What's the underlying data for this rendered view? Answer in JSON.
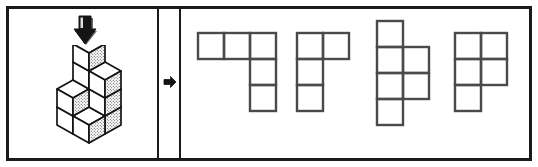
{
  "figure": {
    "type": "spatial-reasoning-puzzle",
    "colors": {
      "frame_border": "#1a1a1a",
      "ink": "#3a3a3a",
      "grid_stroke": "#4a4a4a",
      "cube_stroke": "#1a1a1a",
      "cube_top_fill": "#ffffff",
      "cube_left_fill": "#ffffff",
      "cube_right_fill_pattern": "stipple",
      "divider_fill_pattern": "stipple",
      "background": "#ffffff"
    },
    "border_width_px": 3
  },
  "question_panel": {
    "name": "question-panel",
    "view_arrow": {
      "icon": "arrow-down-icon",
      "direction": "down",
      "meaning": "view from above"
    },
    "cube_figure": {
      "icon": "isometric-cube-stack",
      "cube_count": 10,
      "description": "Isometric stack of unit cubes viewed from above-front-right",
      "cubes": [
        {
          "x": 0,
          "y": 0,
          "z": 0
        },
        {
          "x": 1,
          "y": 0,
          "z": 0
        },
        {
          "x": 0,
          "y": 1,
          "z": 0
        },
        {
          "x": 1,
          "y": 1,
          "z": 0
        },
        {
          "x": 1,
          "y": 0,
          "z": 1
        },
        {
          "x": 1,
          "y": 1,
          "z": 1
        },
        {
          "x": 1,
          "y": 1,
          "z": 2
        },
        {
          "x": 1,
          "y": 0,
          "z": 2
        },
        {
          "x": 1,
          "y": 1,
          "z": 3
        },
        {
          "x": 0,
          "y": 1,
          "z": 1
        }
      ],
      "top_view_footprint": {
        "rows": 2,
        "cols": 2,
        "filled": [
          [
            1,
            1
          ],
          [
            1,
            1
          ]
        ]
      }
    }
  },
  "divider": {
    "name": "divider-strip",
    "pattern": "stipple",
    "arrow": {
      "icon": "arrow-right-icon",
      "direction": "right",
      "meaning": "leads to answer options"
    }
  },
  "options_panel": {
    "name": "options-panel",
    "option_count": 4,
    "options": [
      {
        "id": "option-a",
        "label": "A",
        "shape_name": "L-pentomino-variant",
        "cell_count": 5,
        "grid": {
          "rows": 3,
          "cols": 3
        },
        "filled_cells": [
          [
            1,
            1
          ],
          [
            1,
            0
          ],
          [
            1,
            0
          ]
        ],
        "cell_size_px": 26
      },
      {
        "id": "option-b",
        "label": "B",
        "shape_name": "J-tetromino",
        "cell_count": 4,
        "grid": {
          "rows": 3,
          "cols": 2
        },
        "filled_cells": [
          [
            1,
            1
          ],
          [
            1,
            0
          ],
          [
            1,
            0
          ]
        ],
        "cell_size_px": 26
      },
      {
        "id": "option-c",
        "label": "C",
        "shape_name": "S-hexomino-variant",
        "cell_count": 6,
        "grid": {
          "rows": 4,
          "cols": 2
        },
        "filled_cells": [
          [
            1,
            0
          ],
          [
            1,
            1
          ],
          [
            1,
            1
          ],
          [
            1,
            0
          ]
        ],
        "cell_size_px": 26
      },
      {
        "id": "option-d",
        "label": "D",
        "shape_name": "P-pentomino",
        "cell_count": 5,
        "grid": {
          "rows": 3,
          "cols": 2
        },
        "filled_cells": [
          [
            1,
            1
          ],
          [
            1,
            1
          ],
          [
            1,
            0
          ]
        ],
        "cell_size_px": 26
      }
    ]
  }
}
